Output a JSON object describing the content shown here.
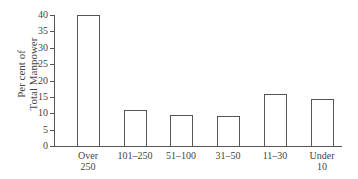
{
  "chart_data": {
    "type": "bar",
    "title": "",
    "xlabel": "",
    "ylabel": "Per cent of Total Manpower",
    "ylabel_lines": [
      "Per cent of",
      "Total Manpower"
    ],
    "categories": [
      "Over 250",
      "101–250",
      "51–100",
      "31–50",
      "11–30",
      "Under 10"
    ],
    "category_lines": [
      [
        "Over",
        "250"
      ],
      [
        "101–250"
      ],
      [
        "51–100"
      ],
      [
        "31–50"
      ],
      [
        "11–30"
      ],
      [
        "Under",
        "10"
      ]
    ],
    "values": [
      40,
      11,
      9.5,
      9.2,
      16,
      14.2
    ],
    "ylim": [
      0,
      40
    ],
    "yticks": [
      "0",
      "5",
      "10",
      "15",
      "20",
      "25",
      "30",
      "35",
      "40"
    ],
    "grid": false,
    "legend": null
  }
}
